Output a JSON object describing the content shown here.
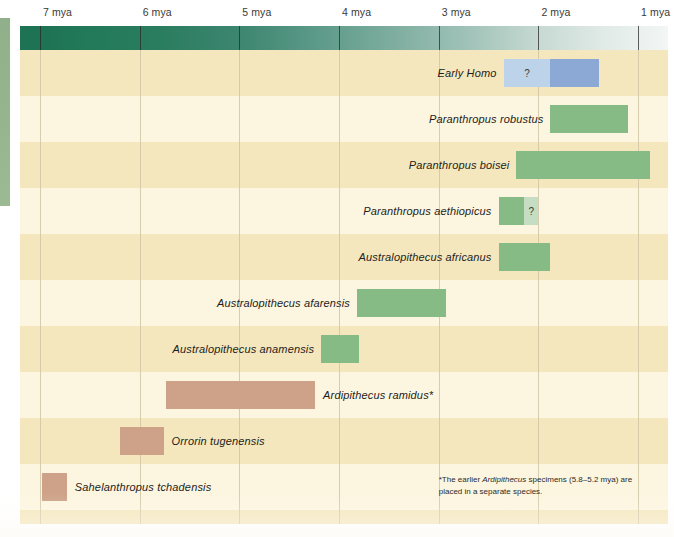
{
  "axis": {
    "unit": "mya",
    "ticks": [
      {
        "label": "7 mya",
        "value": 7
      },
      {
        "label": "6 mya",
        "value": 6
      },
      {
        "label": "5 mya",
        "value": 5
      },
      {
        "label": "4 mya",
        "value": 4
      },
      {
        "label": "3 mya",
        "value": 3
      },
      {
        "label": "2 mya",
        "value": 2
      },
      {
        "label": "1 mya",
        "value": 1
      }
    ]
  },
  "footnote": {
    "prefix": "*The earlier ",
    "italic": "Ardipithecus",
    "suffix": " specimens (5.8–5.2 mya) are placed in a separate species."
  },
  "rows": [
    {
      "name": "early-homo",
      "label_plain": "Early ",
      "label_italic": "Homo",
      "label_side": "right",
      "segments": [
        {
          "start": 2.35,
          "end": 1.88,
          "color": "#bcd3ea",
          "marker": "?"
        },
        {
          "start": 1.88,
          "end": 1.39,
          "color": "#8ca9d6",
          "marker": ""
        }
      ]
    },
    {
      "name": "paranthropus-robustus",
      "label_plain": "Paranthropus robustus",
      "label_italic": "",
      "label_side": "right",
      "segments": [
        {
          "start": 1.88,
          "end": 1.1,
          "color": "#86bb86",
          "marker": ""
        }
      ]
    },
    {
      "name": "paranthropus-boisei",
      "label_plain": "Paranthropus boisei",
      "label_italic": "",
      "label_side": "right",
      "segments": [
        {
          "start": 2.22,
          "end": 0.88,
          "color": "#86bb86",
          "marker": ""
        }
      ]
    },
    {
      "name": "paranthropus-aethiopicus",
      "label_plain": "Paranthropus aethiopicus",
      "label_italic": "",
      "label_side": "right",
      "segments": [
        {
          "start": 2.4,
          "end": 2.14,
          "color": "#86bb86",
          "marker": ""
        },
        {
          "start": 2.14,
          "end": 2.0,
          "color": "#c5ddc2",
          "marker": "?"
        }
      ]
    },
    {
      "name": "australopithecus-africanus",
      "label_plain": "Australopithecus africanus",
      "label_italic": "",
      "label_side": "right",
      "segments": [
        {
          "start": 2.4,
          "end": 1.88,
          "color": "#86bb86",
          "marker": ""
        }
      ]
    },
    {
      "name": "australopithecus-afarensis",
      "label_plain": "Australopithecus afarensis",
      "label_italic": "",
      "label_side": "right",
      "segments": [
        {
          "start": 3.82,
          "end": 2.93,
          "color": "#86bb86",
          "marker": ""
        }
      ]
    },
    {
      "name": "australopithecus-anamensis",
      "label_plain": "Australopithecus anamensis",
      "label_italic": "",
      "label_side": "right",
      "segments": [
        {
          "start": 4.18,
          "end": 3.8,
          "color": "#86bb86",
          "marker": ""
        }
      ]
    },
    {
      "name": "ardipithecus-ramidus",
      "label_plain": "Ardipithecus ramidus*",
      "label_italic": "",
      "label_side": "left",
      "segments": [
        {
          "start": 5.74,
          "end": 4.24,
          "color": "#cda288",
          "marker": ""
        }
      ]
    },
    {
      "name": "orrorin-tugenensis",
      "label_plain": "Orrorin tugenensis",
      "label_italic": "",
      "label_side": "left",
      "segments": [
        {
          "start": 6.2,
          "end": 5.76,
          "color": "#cda288",
          "marker": ""
        }
      ]
    },
    {
      "name": "sahelanthropus-tchadensis",
      "label_plain": "Sahelanthropus tchadensis",
      "label_italic": "",
      "label_side": "left",
      "segments": [
        {
          "start": 6.98,
          "end": 6.73,
          "color": "#cda288",
          "marker": ""
        }
      ]
    }
  ],
  "colors": {
    "plot_background": "#fbf3d8",
    "band_dark": "#f5e7bd",
    "band_light": "#fcf5e0",
    "gridline": "#cfc6a4",
    "green_bar": "#86bb86",
    "green_bar_faded": "#c5ddc2",
    "blue_bar": "#8ca9d6",
    "blue_bar_faded": "#bcd3ea",
    "tan_bar": "#cda288",
    "era_start": "#1f7355",
    "era_end": "#f2f6f4",
    "left_strip": "#8fb08a"
  },
  "chart_data": {
    "type": "bar",
    "title": "",
    "xlabel": "Millions of years ago (mya)",
    "ylabel": "",
    "orientation": "horizontal",
    "axis_direction": "reversed",
    "xlim": [
      7.2,
      0.7
    ],
    "xticks": [
      7,
      6,
      5,
      4,
      3,
      2,
      1
    ],
    "xticklabels": [
      "7 mya",
      "6 mya",
      "5 mya",
      "4 mya",
      "3 mya",
      "2 mya",
      "1 mya"
    ],
    "grid": true,
    "legend": "none",
    "categories": [
      "Early Homo",
      "Paranthropus robustus",
      "Paranthropus boisei",
      "Paranthropus aethiopicus",
      "Australopithecus africanus",
      "Australopithecus afarensis",
      "Australopithecus anamensis",
      "Ardipithecus ramidus*",
      "Orrorin tugenensis",
      "Sahelanthropus tchadensis"
    ],
    "ranges_mya": [
      {
        "category": "Early Homo",
        "start": 2.35,
        "end": 1.39,
        "uncertain_start": 2.35,
        "uncertain_end": 1.88
      },
      {
        "category": "Paranthropus robustus",
        "start": 1.88,
        "end": 1.1
      },
      {
        "category": "Paranthropus boisei",
        "start": 2.22,
        "end": 0.88
      },
      {
        "category": "Paranthropus aethiopicus",
        "start": 2.4,
        "end": 2.0,
        "uncertain_start": 2.14,
        "uncertain_end": 2.0
      },
      {
        "category": "Australopithecus africanus",
        "start": 2.4,
        "end": 1.88
      },
      {
        "category": "Australopithecus afarensis",
        "start": 3.82,
        "end": 2.93
      },
      {
        "category": "Australopithecus anamensis",
        "start": 4.18,
        "end": 3.8
      },
      {
        "category": "Ardipithecus ramidus*",
        "start": 5.74,
        "end": 4.24
      },
      {
        "category": "Orrorin tugenensis",
        "start": 6.2,
        "end": 5.76
      },
      {
        "category": "Sahelanthropus tchadensis",
        "start": 6.98,
        "end": 6.73
      }
    ],
    "annotations": [
      {
        "text": "?",
        "category": "Early Homo",
        "meaning": "uncertain earliest extent"
      },
      {
        "text": "?",
        "category": "Paranthropus aethiopicus",
        "meaning": "uncertain latest extent"
      },
      {
        "text": "*The earlier Ardipithecus specimens (5.8–5.2 mya) are placed in a separate species.",
        "type": "footnote"
      }
    ]
  }
}
